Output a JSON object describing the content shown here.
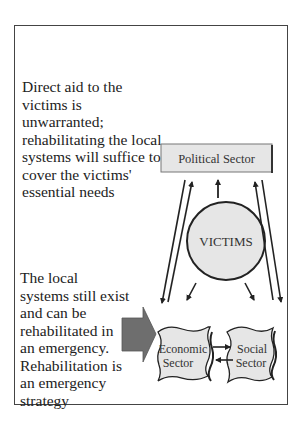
{
  "left_notes": {
    "upper": "Direct aid to the victims is unwarranted; rehabilitating the local systems will suffice to cover the victims' essential needs",
    "lower": "The local systems still exist and can be rehabilitated in an emergency. Rehabilitation is an emergency strategy"
  },
  "nodes": {
    "political": "Political Sector",
    "victims": "VICTIMS",
    "economic_line1": "Economic",
    "economic_line2": "Sector",
    "social_line1": "Social",
    "social_line2": "Sector"
  },
  "colors": {
    "node_fill": "#e6e6e6",
    "pointer_arrow": "#6e6e6e",
    "stroke": "#222222"
  }
}
